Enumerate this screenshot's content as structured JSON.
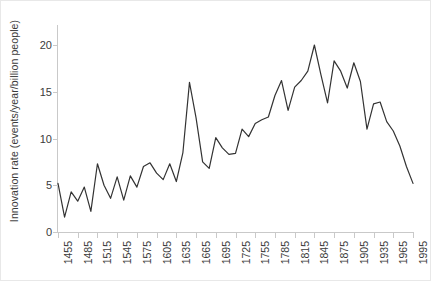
{
  "chart_data": {
    "type": "line",
    "title": "",
    "xlabel": "",
    "ylabel": "Innovation rate (events/year/billion people)",
    "xlim": [
      1455,
      1995
    ],
    "ylim": [
      0,
      22.3
    ],
    "yticks": [
      0,
      5,
      10,
      15,
      20
    ],
    "xticks": [
      1455,
      1485,
      1515,
      1545,
      1575,
      1605,
      1635,
      1665,
      1695,
      1725,
      1755,
      1785,
      1815,
      1845,
      1875,
      1905,
      1935,
      1965,
      1995
    ],
    "grid": false,
    "legend": "none",
    "line_color": "#333333",
    "x": [
      1455,
      1465,
      1475,
      1485,
      1495,
      1505,
      1515,
      1525,
      1535,
      1545,
      1555,
      1565,
      1575,
      1585,
      1595,
      1605,
      1615,
      1625,
      1635,
      1645,
      1655,
      1665,
      1675,
      1685,
      1695,
      1705,
      1715,
      1725,
      1735,
      1745,
      1755,
      1765,
      1775,
      1785,
      1795,
      1805,
      1815,
      1825,
      1835,
      1845,
      1855,
      1865,
      1875,
      1885,
      1895,
      1905,
      1915,
      1925,
      1935,
      1945,
      1955,
      1965,
      1975,
      1985,
      1995
    ],
    "values": [
      5.2,
      1.6,
      4.3,
      3.3,
      4.8,
      2.2,
      7.3,
      5.0,
      3.6,
      5.9,
      3.4,
      6.0,
      4.8,
      7.0,
      7.4,
      6.3,
      5.6,
      7.3,
      5.4,
      8.5,
      16.0,
      12.2,
      7.5,
      6.8,
      10.1,
      9.0,
      8.3,
      8.4,
      11.0,
      10.2,
      11.6,
      12.0,
      12.3,
      14.6,
      16.2,
      13.0,
      15.5,
      16.2,
      17.2,
      20.0,
      16.8,
      13.8,
      18.3,
      17.2,
      15.4,
      18.1,
      16.1,
      11.0,
      13.7,
      13.9,
      11.8,
      10.8,
      9.2,
      7.0,
      5.2
    ],
    "series_name": "Innovation rate"
  },
  "axis": {
    "ytick_labels": [
      "0",
      "5",
      "10",
      "15",
      "20"
    ],
    "xtick_labels": [
      "1455",
      "1485",
      "1515",
      "1545",
      "1575",
      "1605",
      "1635",
      "1665",
      "1695",
      "1725",
      "1755",
      "1785",
      "1815",
      "1845",
      "1875",
      "1905",
      "1935",
      "1965",
      "1995"
    ]
  }
}
